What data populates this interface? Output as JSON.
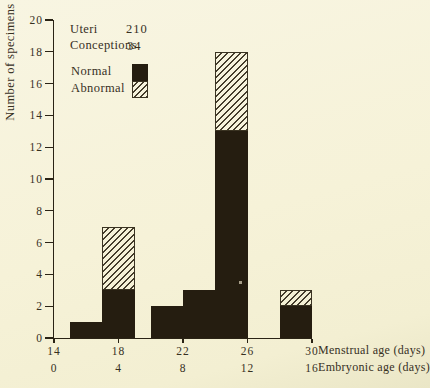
{
  "chart_data": {
    "type": "bar",
    "subtype": "stacked-histogram",
    "title": "",
    "ylabel": "Number of specimens recovered",
    "x_axis": {
      "menstrual": {
        "label": "Menstrual age (days)",
        "ticks": [
          14,
          18,
          22,
          26,
          30
        ],
        "range": [
          14,
          30
        ]
      },
      "embryonic": {
        "label": "Embryonic age (days)",
        "ticks": [
          0,
          4,
          8,
          12,
          16
        ],
        "range": [
          0,
          16
        ],
        "offset_from_menstrual": 14
      }
    },
    "y_axis": {
      "ticks": [
        0,
        2,
        4,
        6,
        8,
        10,
        12,
        14,
        16,
        18,
        20
      ],
      "range": [
        0,
        20
      ]
    },
    "series": [
      {
        "name": "Normal",
        "style": "solid"
      },
      {
        "name": "Abnormal",
        "style": "hatched"
      }
    ],
    "bars": [
      {
        "x0": 15,
        "x1": 17,
        "normal": 1,
        "abnormal": 0
      },
      {
        "x0": 17,
        "x1": 19,
        "normal": 3,
        "abnormal": 4
      },
      {
        "x0": 20,
        "x1": 22,
        "normal": 2,
        "abnormal": 0
      },
      {
        "x0": 22,
        "x1": 24,
        "normal": 3,
        "abnormal": 0
      },
      {
        "x0": 24,
        "x1": 26,
        "normal": 13,
        "abnormal": 5
      },
      {
        "x0": 28,
        "x1": 30,
        "normal": 2,
        "abnormal": 1
      }
    ],
    "legend": {
      "stats": [
        {
          "label": "Uteri",
          "value": "210"
        },
        {
          "label": "Conceptions",
          "value": "34"
        }
      ],
      "keys": [
        {
          "label": "Normal",
          "swatch": "solid"
        },
        {
          "label": "Abnormal",
          "swatch": "hatched"
        }
      ]
    },
    "colors": {
      "ink": "#251d10",
      "background": "#f6f2d8",
      "hatch_line": "#453d2c",
      "text": "#37301f"
    }
  }
}
